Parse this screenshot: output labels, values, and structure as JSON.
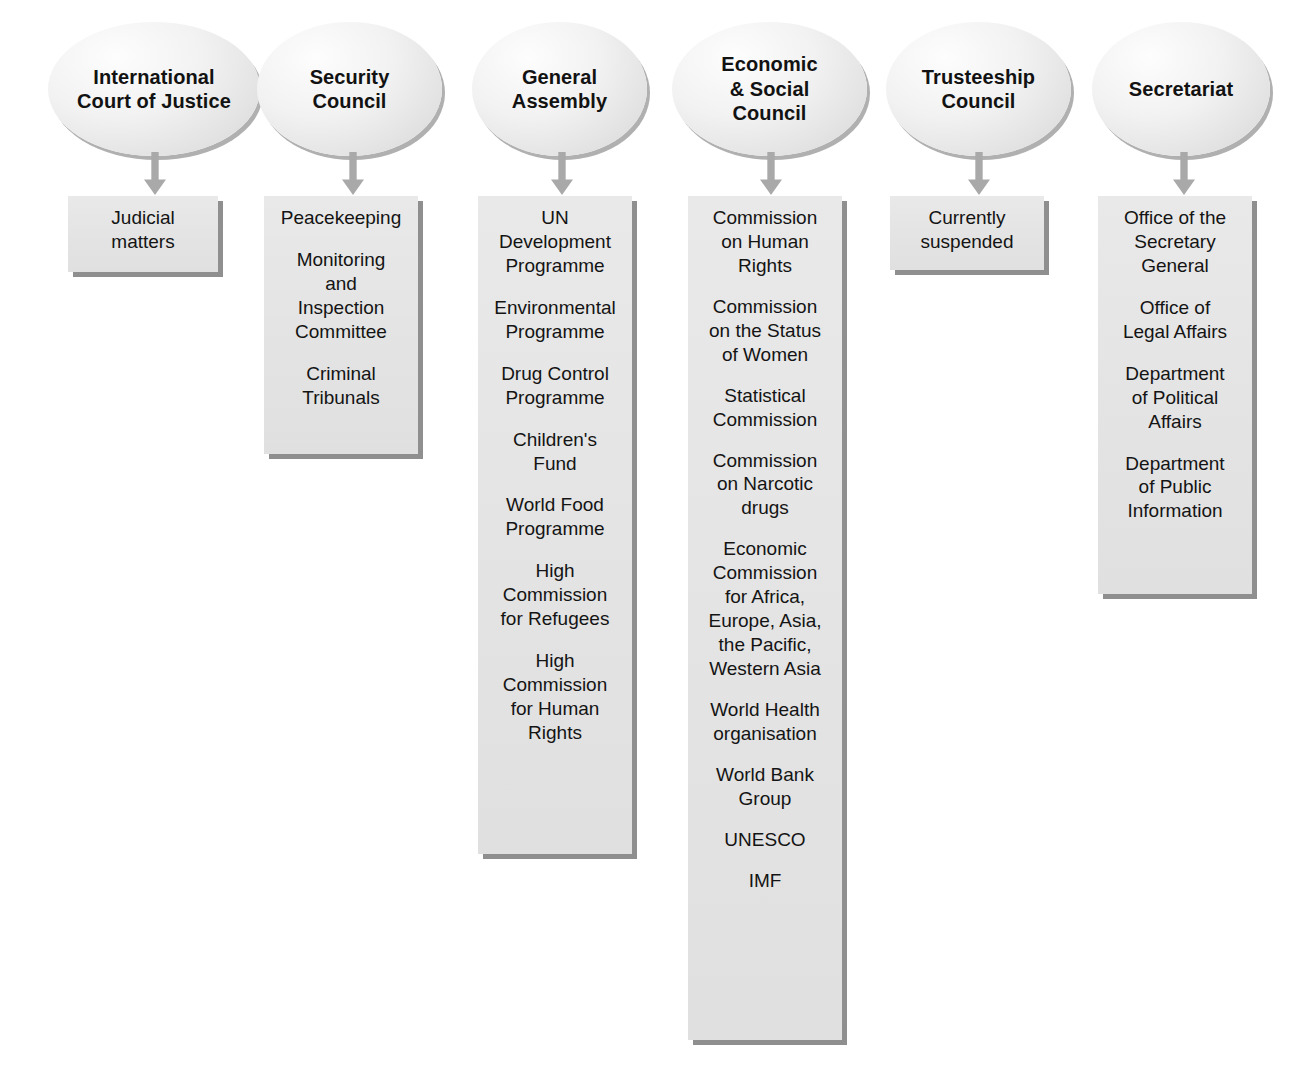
{
  "diagram": {
    "type": "organisational-chart",
    "node_shape_header": "ellipse",
    "node_shape_body": "rectangle",
    "connector": "down-arrow",
    "colors": {
      "background": "#ffffff",
      "oval_fill": "#ededed",
      "box_fill": "#e4e4e4",
      "shadow": "#8f8f8f",
      "arrow": "#a8a8a8",
      "text": "#141414"
    }
  },
  "columns": [
    {
      "id": "international-court-of-justice",
      "header": "International\nCourt of Justice",
      "items": [
        "Judicial\nmatters"
      ]
    },
    {
      "id": "security-council",
      "header": "Security\nCouncil",
      "items": [
        "Peacekeeping",
        "Monitoring\nand\nInspection\nCommittee",
        "Criminal\nTribunals"
      ]
    },
    {
      "id": "general-assembly",
      "header": "General\nAssembly",
      "items": [
        "UN\nDevelopment\nProgramme",
        "Environmental\nProgramme",
        "Drug Control\nProgramme",
        "Children's\nFund",
        "World Food\nProgramme",
        "High\nCommission\nfor Refugees",
        "High\nCommission\nfor Human\nRights"
      ]
    },
    {
      "id": "economic-and-social-council",
      "header": "Economic\n& Social\nCouncil",
      "items": [
        "Commission\non Human\nRights",
        "Commission\non the Status\nof Women",
        "Statistical\nCommission",
        "Commission\non Narcotic\ndrugs",
        "Economic\nCommission\nfor Africa,\nEurope, Asia,\nthe Pacific,\nWestern Asia",
        "World Health\norganisation",
        "World Bank\nGroup",
        "UNESCO",
        "IMF"
      ]
    },
    {
      "id": "trusteeship-council",
      "header": "Trusteeship\nCouncil",
      "items": [
        "Currently\nsuspended"
      ]
    },
    {
      "id": "secretariat",
      "header": "Secretariat",
      "items": [
        "Office of the\nSecretary\nGeneral",
        "Office of\nLegal Affairs",
        "Department\nof Political\nAffairs",
        "Department\nof Public\nInformation"
      ]
    }
  ],
  "layout": {
    "ovals": [
      {
        "left": 48,
        "top": 22,
        "width": 212,
        "height": 134
      },
      {
        "left": 257,
        "top": 22,
        "width": 185,
        "height": 134
      },
      {
        "left": 472,
        "top": 22,
        "width": 175,
        "height": 134
      },
      {
        "left": 672,
        "top": 22,
        "width": 195,
        "height": 134
      },
      {
        "left": 886,
        "top": 22,
        "width": 185,
        "height": 134
      },
      {
        "left": 1092,
        "top": 22,
        "width": 178,
        "height": 134
      }
    ],
    "arrows": [
      {
        "left": 142,
        "top": 152,
        "height": 44
      },
      {
        "left": 340,
        "top": 152,
        "height": 44
      },
      {
        "left": 549,
        "top": 152,
        "height": 44
      },
      {
        "left": 758,
        "top": 152,
        "height": 44
      },
      {
        "left": 966,
        "top": 152,
        "height": 44
      },
      {
        "left": 1171,
        "top": 152,
        "height": 44
      }
    ],
    "boxes": [
      {
        "left": 68,
        "top": 196,
        "width": 150,
        "height": 76,
        "gap": 10
      },
      {
        "left": 264,
        "top": 196,
        "width": 154,
        "height": 258,
        "gap": 18
      },
      {
        "left": 478,
        "top": 196,
        "width": 154,
        "height": 658,
        "gap": 18
      },
      {
        "left": 688,
        "top": 196,
        "width": 154,
        "height": 844,
        "gap": 17
      },
      {
        "left": 890,
        "top": 196,
        "width": 154,
        "height": 74,
        "gap": 10
      },
      {
        "left": 1098,
        "top": 196,
        "width": 154,
        "height": 398,
        "gap": 18
      }
    ]
  }
}
